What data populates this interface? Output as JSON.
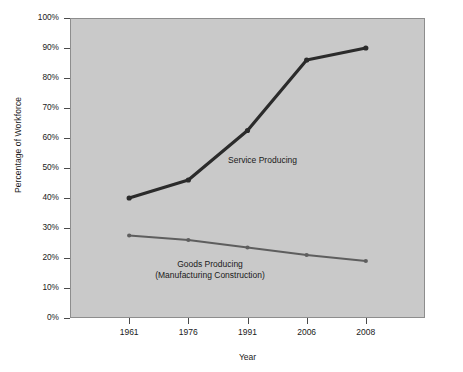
{
  "chart_data": {
    "type": "line",
    "title": "",
    "xlabel": "Year",
    "ylabel": "Percentage of Workforce",
    "categories": [
      "1961",
      "1976",
      "1991",
      "2006",
      "2008"
    ],
    "ylim": [
      0,
      100
    ],
    "y_ticks": [
      "0%",
      "10%",
      "20%",
      "30%",
      "40%",
      "50%",
      "60%",
      "70%",
      "80%",
      "90%",
      "100%"
    ],
    "y_tick_values": [
      0,
      10,
      20,
      30,
      40,
      50,
      60,
      70,
      80,
      90,
      100
    ],
    "grid": false,
    "legend_position": "inline-annotations",
    "series": [
      {
        "name": "Service Producing",
        "label_line1": "Service Producing",
        "label_line2": "",
        "color": "#2b2b2b",
        "line_width": 3.2,
        "values": [
          40,
          46,
          62.5,
          86,
          90
        ]
      },
      {
        "name": "Goods Producing (Manufacturing Construction)",
        "label_line1": "Goods Producing",
        "label_line2": "(Manufacturing Construction)",
        "color": "#5e5e5e",
        "line_width": 1.8,
        "values": [
          27.5,
          26,
          23.5,
          21,
          19
        ]
      }
    ],
    "plot_background": "#c9c9c9",
    "plot_border": "#8d8d8d",
    "page_background": "#ffffff"
  }
}
